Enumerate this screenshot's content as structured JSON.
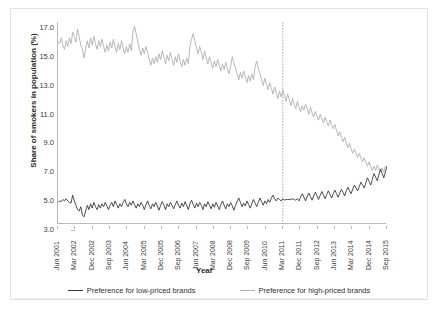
{
  "chart_data": {
    "type": "line",
    "title": "",
    "xlabel": "Year",
    "ylabel": "Share of smokers in population (%)",
    "ylim": [
      3.0,
      17.0
    ],
    "ytick_labels": [
      "3.0",
      "5.0",
      "7.0",
      "9.0",
      "11.0",
      "13.0",
      "15.0",
      "17.0"
    ],
    "ytick_values": [
      3.0,
      5.0,
      7.0,
      9.0,
      11.0,
      13.0,
      15.0,
      17.0
    ],
    "xtick_labels": [
      "Jun 2001",
      "Mar 2002",
      "Dec 2002",
      "Sep 2003",
      "Jun 2004",
      "Mar 2005",
      "Dec 2005",
      "Sep 2006",
      "Jun 2007",
      "Mar 2008",
      "Dec 2008",
      "Sep 2009",
      "Jun 2010",
      "Mar 2011",
      "Dec 2011",
      "Sep 2012",
      "Jun 2013",
      "Mar 2014",
      "Dec 2014",
      "Sep 2015"
    ],
    "grid": false,
    "legend_position": "bottom",
    "annotations": [
      {
        "name": "vertical-dashed-line",
        "type": "vline",
        "x_label": "Dec 2012",
        "x_index": 138,
        "style": "dotted",
        "color": "#aaaaaa"
      }
    ],
    "series": [
      {
        "name": "Preference for low-priced brands",
        "color": "#3a3a3a",
        "values": [
          4.5,
          4.6,
          4.55,
          4.7,
          4.6,
          4.75,
          4.6,
          4.5,
          4.45,
          5.0,
          4.6,
          4.3,
          4.0,
          3.9,
          4.2,
          3.6,
          3.5,
          3.9,
          4.3,
          4.0,
          4.4,
          4.1,
          4.5,
          4.2,
          4.0,
          4.35,
          4.1,
          4.4,
          4.2,
          4.5,
          4.25,
          4.0,
          4.3,
          4.5,
          4.2,
          4.6,
          4.35,
          4.1,
          4.4,
          4.2,
          4.5,
          4.7,
          4.4,
          4.2,
          4.5,
          4.3,
          4.6,
          4.35,
          4.1,
          4.4,
          4.2,
          4.5,
          4.3,
          4.0,
          4.35,
          4.6,
          4.3,
          4.05,
          4.4,
          4.2,
          4.5,
          4.25,
          3.95,
          4.3,
          4.55,
          4.3,
          4.0,
          4.4,
          4.2,
          4.5,
          4.3,
          4.05,
          4.35,
          4.6,
          4.3,
          4.1,
          4.45,
          4.2,
          4.55,
          4.3,
          4.0,
          4.4,
          4.65,
          4.35,
          4.1,
          4.45,
          4.2,
          4.5,
          4.3,
          4.0,
          4.4,
          4.2,
          4.55,
          4.3,
          4.05,
          4.4,
          4.15,
          4.5,
          4.25,
          4.0,
          4.35,
          4.6,
          4.3,
          4.05,
          4.4,
          4.2,
          4.5,
          4.25,
          3.95,
          4.3,
          4.55,
          4.8,
          4.5,
          4.2,
          4.45,
          4.25,
          4.6,
          4.35,
          4.1,
          4.4,
          4.7,
          4.45,
          4.2,
          4.5,
          4.8,
          4.55,
          4.3,
          4.6,
          4.4,
          4.7,
          4.5,
          4.8,
          5.0,
          4.75,
          4.6,
          4.8,
          4.7,
          4.6,
          4.75,
          4.65,
          4.7,
          4.7,
          4.7,
          4.7,
          4.75,
          4.7,
          4.65,
          4.75,
          4.6,
          4.9,
          5.1,
          4.85,
          4.6,
          4.9,
          5.15,
          4.9,
          4.65,
          4.95,
          5.2,
          4.95,
          4.7,
          5.0,
          5.25,
          5.0,
          4.75,
          5.05,
          5.3,
          5.05,
          4.8,
          5.1,
          5.35,
          5.1,
          4.85,
          5.15,
          5.4,
          5.2,
          4.95,
          5.3,
          5.55,
          5.3,
          5.1,
          5.45,
          5.7,
          5.5,
          5.3,
          5.6,
          5.9,
          5.7,
          5.5,
          5.85,
          6.2,
          5.95,
          5.7,
          6.1,
          6.5,
          6.25,
          6.0,
          6.4,
          6.8,
          6.5,
          6.2,
          6.6,
          7.0
        ]
      },
      {
        "name": "Preference for high-priced brands",
        "color": "#b0b0b0",
        "values": [
          15.6,
          15.5,
          15.9,
          15.4,
          15.1,
          15.7,
          15.3,
          15.9,
          15.5,
          16.3,
          16.0,
          15.6,
          16.5,
          16.0,
          15.4,
          15.1,
          14.5,
          15.2,
          15.7,
          15.2,
          15.9,
          15.4,
          16.0,
          15.5,
          15.1,
          15.7,
          15.3,
          15.8,
          15.3,
          14.9,
          15.4,
          15.0,
          15.6,
          15.2,
          15.8,
          15.3,
          14.9,
          15.5,
          15.1,
          15.7,
          15.2,
          14.8,
          15.3,
          14.9,
          15.5,
          15.0,
          16.3,
          16.7,
          16.2,
          15.6,
          15.1,
          14.7,
          15.2,
          14.8,
          15.3,
          14.9,
          14.4,
          14.0,
          14.5,
          14.1,
          14.6,
          14.2,
          14.8,
          14.4,
          15.0,
          14.6,
          14.1,
          14.7,
          14.3,
          14.9,
          14.4,
          14.0,
          14.6,
          14.2,
          14.8,
          14.3,
          13.9,
          14.4,
          14.0,
          14.5,
          14.1,
          15.3,
          15.8,
          16.2,
          15.7,
          15.2,
          14.8,
          15.3,
          14.9,
          14.4,
          15.0,
          14.5,
          14.1,
          14.6,
          14.2,
          13.8,
          14.3,
          13.9,
          14.4,
          14.0,
          13.6,
          14.1,
          13.7,
          14.2,
          13.8,
          13.4,
          13.9,
          14.6,
          14.2,
          13.8,
          13.4,
          13.0,
          13.5,
          13.1,
          13.6,
          13.2,
          12.8,
          13.3,
          12.9,
          13.4,
          13.0,
          13.9,
          14.3,
          13.8,
          13.4,
          13.0,
          12.6,
          13.1,
          12.7,
          12.3,
          12.8,
          12.4,
          12.0,
          12.5,
          12.1,
          11.7,
          12.2,
          11.8,
          12.3,
          11.9,
          11.5,
          12.0,
          11.6,
          11.2,
          11.7,
          11.3,
          11.0,
          11.5,
          11.1,
          10.8,
          11.2,
          10.9,
          11.3,
          11.0,
          10.6,
          11.1,
          10.7,
          10.4,
          10.8,
          10.5,
          10.2,
          10.6,
          10.3,
          10.0,
          10.4,
          10.1,
          9.8,
          10.2,
          9.9,
          9.6,
          9.9,
          9.5,
          9.1,
          9.4,
          9.0,
          8.7,
          9.0,
          8.6,
          8.3,
          8.6,
          8.2,
          7.9,
          8.2,
          7.9,
          7.6,
          7.9,
          7.6,
          7.3,
          7.6,
          7.3,
          7.0,
          7.3,
          7.0,
          6.7,
          7.0,
          6.7,
          7.1,
          6.9,
          6.6,
          6.9,
          6.6,
          7.0
        ]
      }
    ]
  },
  "legend": {
    "items": [
      {
        "label": "Preference for low-priced brands",
        "color": "#3a3a3a"
      },
      {
        "label": "Preference for high-priced brands",
        "color": "#b0b0b0"
      }
    ]
  },
  "axes": {
    "x_title": "Year",
    "y_title": "Share of smokers in population (%)"
  }
}
